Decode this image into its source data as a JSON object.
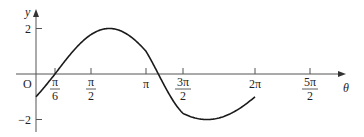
{
  "chart_data": {
    "type": "line",
    "title": "",
    "function": "y = 2 sin(θ − π/6)",
    "xlabel": "θ",
    "ylabel": "y",
    "origin_label": "O",
    "x_ticks": [
      {
        "value": 0.5235988,
        "label_num": "π",
        "label_den": "6"
      },
      {
        "value": 1.5707963,
        "label_num": "π",
        "label_den": "2"
      },
      {
        "value": 3.1415927,
        "label": "π"
      },
      {
        "value": 4.712389,
        "label_num": "3π",
        "label_den": "2"
      },
      {
        "value": 6.2831853,
        "label": "2π"
      },
      {
        "value": 7.8539816,
        "label_num": "5π",
        "label_den": "2"
      }
    ],
    "y_ticks": [
      {
        "value": 2,
        "label": "2"
      },
      {
        "value": -2,
        "label": "−2"
      }
    ],
    "xlim": [
      0,
      6.2831853
    ],
    "ylim": [
      -2,
      2
    ],
    "grid": false,
    "legend": null,
    "series": [
      {
        "name": "2 sin(θ − π/6)",
        "x": [
          0,
          0.5236,
          1.5708,
          2.0944,
          3.1416,
          3.6652,
          4.7124,
          5.236,
          6.2832
        ],
        "y": [
          -1,
          0,
          1.732,
          2,
          1,
          0,
          -1.732,
          -2,
          -1
        ]
      }
    ],
    "colors": {
      "line": "#1a1a1a",
      "axis": "#555555"
    }
  }
}
